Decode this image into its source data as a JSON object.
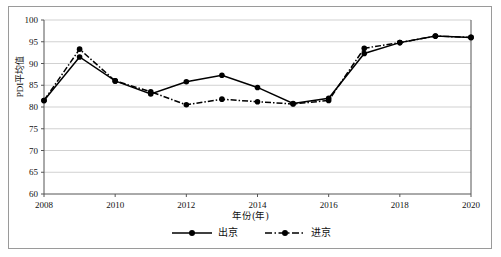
{
  "chart_data": {
    "type": "line",
    "title": "",
    "xlabel": "年份(年)",
    "ylabel": "PDI平均值",
    "xlim": [
      2008,
      2020
    ],
    "ylim": [
      60,
      100
    ],
    "xticks": [
      "2008",
      "2010",
      "2012",
      "2014",
      "2016",
      "2018",
      "2020"
    ],
    "yticks": [
      "60",
      "65",
      "70",
      "75",
      "80",
      "85",
      "90",
      "95",
      "100"
    ],
    "grid": true,
    "legend_position": "bottom-center",
    "x": [
      2008,
      2009,
      2010,
      2011,
      2012,
      2013,
      2014,
      2015,
      2016,
      2017,
      2018,
      2019,
      2020
    ],
    "series": [
      {
        "name": "出京",
        "style": "solid",
        "marker": "filled-circle",
        "color": "#000000",
        "values": [
          81.5,
          91.5,
          86.0,
          83.0,
          85.8,
          87.3,
          84.5,
          80.8,
          82.0,
          92.3,
          94.8,
          96.3,
          96.0
        ]
      },
      {
        "name": "进京",
        "style": "dash-dot",
        "marker": "filled-circle",
        "color": "#000000",
        "values": [
          81.5,
          93.3,
          86.0,
          83.5,
          80.5,
          81.8,
          81.2,
          80.7,
          81.5,
          93.5,
          94.8,
          96.3,
          96.0
        ]
      }
    ]
  },
  "legend": {
    "items": [
      {
        "label": "出京"
      },
      {
        "label": "进京"
      }
    ]
  }
}
